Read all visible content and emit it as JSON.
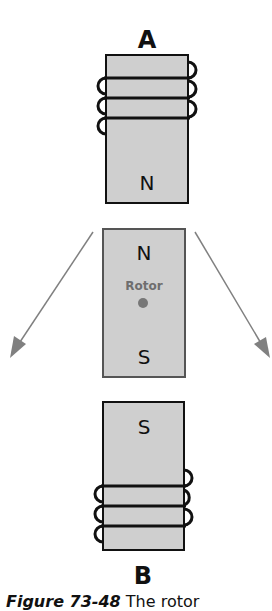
{
  "diagram": {
    "stator_top": {
      "label": "A",
      "pole": "N"
    },
    "rotor": {
      "label": "Rotor",
      "pole_top": "N",
      "pole_bottom": "S"
    },
    "stator_bottom": {
      "label": "B",
      "pole": "S"
    },
    "arrows": [
      "left-arrow",
      "right-arrow"
    ],
    "colors": {
      "fill": "#cfcfcf",
      "stroke": "#111111",
      "arrow": "#808080",
      "rotor_text": "#6e6e6e"
    }
  },
  "caption": {
    "figure": "Figure 73-48",
    "text": "The rotor"
  }
}
